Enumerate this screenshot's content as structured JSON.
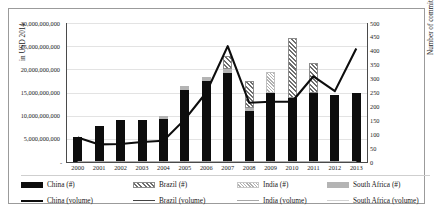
{
  "axes": {
    "left_title": "in USD 2014",
    "right_title": "Number of commitments",
    "left_ticks": [
      "30,000,000,000",
      "25,000,000,000",
      "20,000,000,000",
      "15,000,000,000",
      "10,000,000,000",
      "5,000,000,000",
      "-"
    ],
    "right_ticks": [
      "500",
      "450",
      "400",
      "350",
      "300",
      "250",
      "200",
      "150",
      "100",
      "50",
      "0"
    ]
  },
  "legend": {
    "row1": [
      {
        "name": "china-hash",
        "label": "China (#)",
        "swatch": "sw-china"
      },
      {
        "name": "brazil-hash",
        "label": "Brazil (#)",
        "swatch": "sw-brazil"
      },
      {
        "name": "india-hash",
        "label": "India (#)",
        "swatch": "sw-india"
      },
      {
        "name": "south-africa-hash",
        "label": "South Africa (#)",
        "swatch": "sw-sa"
      }
    ],
    "row2": [
      {
        "name": "china-volume",
        "label": "China (volume)",
        "line": "ln-china"
      },
      {
        "name": "brazil-volume",
        "label": "Brazil (volume)",
        "line": "ln-brazil"
      },
      {
        "name": "india-volume",
        "label": "India (volume)",
        "line": "ln-india"
      },
      {
        "name": "south-africa-volume",
        "label": "South Africa (volume)",
        "line": "ln-sa"
      }
    ]
  },
  "chart_data": {
    "type": "bar",
    "title": "",
    "xlabel": "",
    "ylabel": "in USD 2014",
    "y2label": "Number of commitments",
    "categories": [
      "2000",
      "2001",
      "2002",
      "2003",
      "2004",
      "2005",
      "2006",
      "2007",
      "2008",
      "2009",
      "2010",
      "2011",
      "2012",
      "2013"
    ],
    "ylim": [
      0,
      30000000000
    ],
    "y2lim": [
      0,
      500
    ],
    "grid": true,
    "legend_position": "bottom",
    "series": [
      {
        "name": "China (#)",
        "axis": "right",
        "type": "bar",
        "values": [
          90,
          130,
          150,
          150,
          155,
          260,
          290,
          320,
          185,
          250,
          230,
          250,
          240,
          250
        ]
      },
      {
        "name": "South Africa (#)",
        "axis": "right",
        "type": "bar",
        "stacked_on": "China (#)",
        "values": [
          0,
          0,
          0,
          0,
          10,
          15,
          15,
          15,
          10,
          0,
          0,
          0,
          0,
          0
        ]
      },
      {
        "name": "Brazil (#)",
        "axis": "right",
        "type": "bar",
        "stacked_on": "China (#)",
        "values": [
          0,
          0,
          0,
          0,
          0,
          0,
          0,
          45,
          95,
          0,
          215,
          105,
          0,
          0
        ]
      },
      {
        "name": "India (#)",
        "axis": "right",
        "type": "bar",
        "stacked_on": "China (#)",
        "values": [
          0,
          0,
          0,
          0,
          0,
          0,
          0,
          0,
          0,
          75,
          0,
          0,
          0,
          0
        ]
      },
      {
        "name": "China (volume)",
        "axis": "left",
        "type": "line",
        "values": [
          5300000000,
          3800000000,
          3900000000,
          4300000000,
          4600000000,
          9200000000,
          15000000000,
          25000000000,
          12800000000,
          13000000000,
          13000000000,
          18500000000,
          15300000000,
          24500000000
        ]
      },
      {
        "name": "Brazil (volume)",
        "axis": "left",
        "type": "line",
        "values": [
          0,
          0,
          0,
          0,
          0,
          0,
          0,
          0,
          0,
          0,
          0,
          0,
          0,
          0
        ]
      },
      {
        "name": "India (volume)",
        "axis": "left",
        "type": "line",
        "values": [
          0,
          0,
          0,
          0,
          0,
          0,
          0,
          0,
          0,
          0,
          0,
          0,
          0,
          0
        ]
      },
      {
        "name": "South Africa (volume)",
        "axis": "left",
        "type": "line",
        "values": [
          0,
          0,
          0,
          0,
          0,
          0,
          0,
          0,
          0,
          0,
          0,
          0,
          0,
          0
        ]
      }
    ]
  }
}
